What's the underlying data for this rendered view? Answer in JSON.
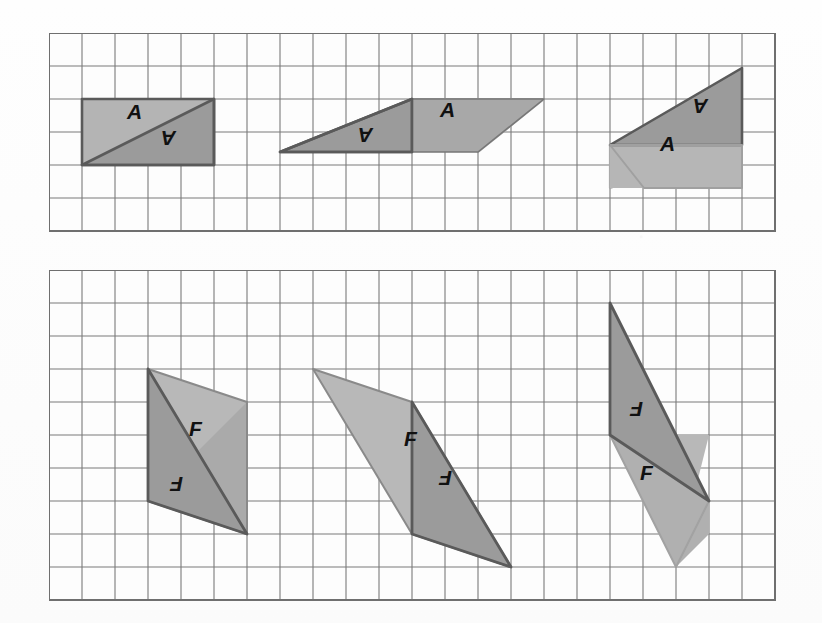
{
  "document": {
    "type": "geometry-worksheet",
    "background_color": "#fdfdfd",
    "description": "Two square-grid panels showing pairs of congruent triangles labeled A (top panel) and F (bottom panel) in three transformation stages each."
  },
  "colors": {
    "grid_line": "#6f6f6f",
    "grid_line_light": "#cfcfcf",
    "panel_border": "#6f6f6f",
    "shape_dark_fill": "#9b9b9b",
    "shape_light_fill": "#c3c3c3",
    "shape_stroke_dark": "#575757",
    "shape_stroke_light": "#a9a9a9",
    "label_color": "#111111",
    "paper": "#fdfdfd"
  },
  "panels": [
    {
      "id": "top-panel",
      "name": "triangle-a-panel",
      "grid": {
        "x": 49,
        "y": 33,
        "cell": 33,
        "cols": 22,
        "rows": 6
      },
      "figures": [
        {
          "id": "a-figure-1",
          "name": "figure-a-1",
          "caption": "Pair of triangles A forming a rectangle",
          "labels": [
            {
              "text": "A",
              "x": 127,
              "y": 112,
              "rotation": 0
            },
            {
              "text": "A",
              "x": 176,
              "y": 138,
              "rotation": 180
            }
          ]
        },
        {
          "id": "a-figure-2",
          "name": "figure-a-2",
          "caption": "Triangle A rotated into a parallelogram arrangement",
          "labels": [
            {
              "text": "A",
              "x": 373,
              "y": 142,
              "rotation": 180
            },
            {
              "text": "A",
              "x": 447,
              "y": 110,
              "rotation": 0
            }
          ]
        },
        {
          "id": "a-figure-3",
          "name": "figure-a-3",
          "caption": "Triangle A separated into upper and lower copies",
          "labels": [
            {
              "text": "A",
              "x": 708,
              "y": 106,
              "rotation": 180
            },
            {
              "text": "A",
              "x": 669,
              "y": 144,
              "rotation": 0
            }
          ]
        }
      ]
    },
    {
      "id": "bottom-panel",
      "name": "triangle-f-panel",
      "grid": {
        "x": 49,
        "y": 270,
        "cell": 33,
        "cols": 22,
        "rows": 10
      },
      "figures": [
        {
          "id": "f-figure-1",
          "name": "figure-f-1",
          "caption": "Pair of triangles F forming a parallelogram",
          "labels": [
            {
              "text": "F",
              "x": 196,
              "y": 430,
              "rotation": 0
            },
            {
              "text": "F",
              "x": 183,
              "y": 484,
              "rotation": 180
            }
          ]
        },
        {
          "id": "f-figure-2",
          "name": "figure-f-2",
          "caption": "Triangles F arranged as a slanted parallelogram",
          "labels": [
            {
              "text": "F",
              "x": 412,
              "y": 439,
              "rotation": 0
            },
            {
              "text": "F",
              "x": 452,
              "y": 478,
              "rotation": 180
            }
          ]
        },
        {
          "id": "f-figure-3",
          "name": "figure-f-3",
          "caption": "Triangles F split into upper dark and lower light copies",
          "labels": [
            {
              "text": "F",
              "x": 636,
              "y": 409,
              "rotation": 180
            },
            {
              "text": "F",
              "x": 647,
              "y": 473,
              "rotation": 0
            }
          ]
        }
      ]
    }
  ],
  "shapes": {
    "top": {
      "fig1_light": "82,94 214,94 214,145 82,145",
      "fig1_dark": "82,145 214,94 214,145",
      "fig2_dark": "280,152 412,94 412,152",
      "fig2_light": "412,94 544,94 412,152",
      "fig3_dark": "610,145 742,68 742,145",
      "fig3_light": "610,145 742,145 610,188"
    },
    "bottom": {
      "fig1_light": "148,369 247,369 247,519 148,519",
      "fig1_dark": "148,369 247,519 148,468",
      "fig1_dark2": "148,369 247,369 247,519",
      "fig2_light": "313,369 412,402 412,534",
      "fig2_dark": "412,402 511,534 412,534",
      "fig2_mid": "313,369 412,402 412,534 511,534",
      "fig3_dark": "610,303 610,435 709,435",
      "fig3_light": "610,435 709,435 676,567"
    }
  },
  "figure_count": {
    "top": 3,
    "bottom": 3,
    "total": 6
  }
}
